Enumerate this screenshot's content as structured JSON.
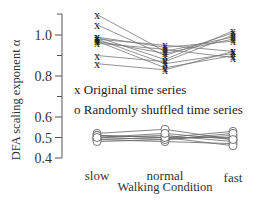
{
  "chart_data": {
    "type": "line",
    "title": "",
    "xlabel": "Walking Condition",
    "ylabel": "DFA scaling exponent α",
    "categories": [
      "slow",
      "normal",
      "fast"
    ],
    "ylim": [
      0.4,
      1.12
    ],
    "yticks": [
      0.4,
      0.5,
      0.6,
      0.8,
      1.0
    ],
    "ytick_labels": [
      "0.4",
      "0.5",
      "0.6",
      "0.8",
      "1.0"
    ],
    "grid": false,
    "legend": [
      {
        "marker": "x",
        "label": "Original time series"
      },
      {
        "marker": "o",
        "label": "Randomly shuffled time series"
      }
    ],
    "legend_position": "center (inside plot)",
    "series": [
      {
        "name": "Original time series",
        "marker": "x",
        "subjects": [
          [
            1.1,
            0.92,
            0.99
          ],
          [
            1.05,
            0.9,
            1.01
          ],
          [
            0.99,
            0.94,
            0.97
          ],
          [
            0.99,
            0.88,
            1.02
          ],
          [
            0.98,
            0.95,
            0.92
          ],
          [
            0.98,
            0.86,
            0.91
          ],
          [
            0.97,
            0.91,
            0.98
          ],
          [
            0.97,
            0.84,
            0.9
          ],
          [
            0.96,
            0.93,
            0.89
          ],
          [
            0.9,
            0.87,
            1.0
          ],
          [
            0.86,
            0.83,
            0.92
          ]
        ]
      },
      {
        "name": "Randomly shuffled time series",
        "marker": "o",
        "subjects": [
          [
            0.52,
            0.54,
            0.49
          ],
          [
            0.51,
            0.5,
            0.53
          ],
          [
            0.5,
            0.49,
            0.51
          ],
          [
            0.5,
            0.51,
            0.48
          ],
          [
            0.49,
            0.5,
            0.5
          ],
          [
            0.49,
            0.48,
            0.47
          ],
          [
            0.48,
            0.49,
            0.52
          ],
          [
            0.51,
            0.5,
            0.46
          ],
          [
            0.5,
            0.52,
            0.49
          ]
        ]
      }
    ]
  }
}
